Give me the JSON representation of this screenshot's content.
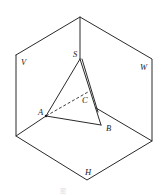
{
  "figure": {
    "type": "three-view projection box with tetrahedron",
    "planes": {
      "V": {
        "label": "V",
        "x": 21,
        "y": 65
      },
      "W": {
        "label": "W",
        "x": 140,
        "y": 70
      },
      "H": {
        "label": "H",
        "x": 85,
        "y": 175
      }
    },
    "points": {
      "S": {
        "label": "S",
        "x": 80,
        "y": 59,
        "lx": 73,
        "ly": 57
      },
      "A": {
        "label": "A",
        "x": 46,
        "y": 116,
        "lx": 38,
        "ly": 115
      },
      "B": {
        "label": "B",
        "x": 101,
        "y": 125,
        "lx": 106,
        "ly": 131
      },
      "C": {
        "label": "C",
        "x": 91,
        "y": 93,
        "lx": 82,
        "ly": 103
      }
    },
    "box": {
      "top": [
        80,
        17
      ],
      "left_top": [
        16,
        55
      ],
      "left_bottom": [
        16,
        136
      ],
      "bottom": [
        87,
        180
      ],
      "right_bottom": [
        152,
        141
      ],
      "right_top": [
        152,
        59
      ],
      "center": [
        96,
        108
      ]
    },
    "caption": "图"
  }
}
